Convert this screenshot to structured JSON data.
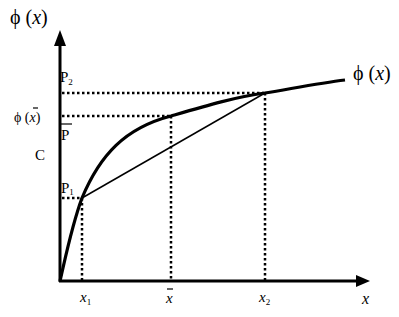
{
  "diagram": {
    "y_axis_label": "ϕ (x)",
    "x_axis_label": "x",
    "curve_label": "ϕ (x)",
    "labels": {
      "p2": "P",
      "p2_sub": "2",
      "phi_xbar_phi": "ϕ (",
      "phi_xbar_x": "x",
      "phi_xbar_close": ")",
      "pbar": "P",
      "c": "C",
      "p1": "P",
      "p1_sub": "1",
      "x1": "x",
      "x1_sub": "1",
      "xbar": "x",
      "x2": "x",
      "x2_sub": "2"
    },
    "points": {
      "origin": [
        60,
        281
      ],
      "p1": [
        82,
        198
      ],
      "xbar_curve": [
        171,
        116
      ],
      "xbar_chord": [
        171,
        145
      ],
      "p2": [
        265,
        93
      ],
      "curve_end": [
        345,
        80
      ]
    },
    "colors": {
      "ink": "#000000",
      "background": "#ffffff"
    }
  }
}
